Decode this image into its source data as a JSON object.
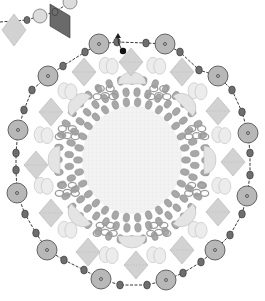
{
  "diagram": {
    "title": "Beaded medallion pattern",
    "kind": "beadwork-pattern",
    "colors": {
      "background": "#ffffff",
      "center_grid": "#f3f3f3",
      "grid_line": "#e6e6e6",
      "large_bead_fill": "#b8b8b8",
      "large_bead_stroke": "#555555",
      "small_bead_fill": "#6e6e6e",
      "small_bead_stroke": "#333333",
      "rondelle_fill": "#a8a8a8",
      "rondelle_stroke": "#8a8a8a",
      "diamond_fill": "#d2d2d2",
      "diamond_stroke": "#b4b4b4",
      "diamond_dark_fill": "#6a6a6a",
      "light_oval_fill": "#ececec",
      "light_oval_stroke": "#bdbdbd",
      "half_dome_fill": "#e4e4e4",
      "ring_stroke": "#9a9a9a",
      "thread": "#222222",
      "black_bead": "#111111"
    },
    "center": [
      132,
      160
    ],
    "outer_large_beads": [
      [
        99,
        44
      ],
      [
        165,
        44
      ],
      [
        218,
        76
      ],
      [
        248,
        133
      ],
      [
        247,
        196
      ],
      [
        215,
        250
      ],
      [
        166,
        280
      ],
      [
        101,
        279
      ],
      [
        47,
        250
      ],
      [
        17,
        193
      ],
      [
        18,
        130
      ],
      [
        48,
        76
      ]
    ],
    "outer_small_beads": [
      [
        117,
        42
      ],
      [
        146,
        43
      ],
      [
        180,
        52
      ],
      [
        199,
        70
      ],
      [
        232,
        90
      ],
      [
        242,
        112
      ],
      [
        250,
        153
      ],
      [
        250,
        175
      ],
      [
        242,
        214
      ],
      [
        230,
        235
      ],
      [
        201,
        262
      ],
      [
        183,
        273
      ],
      [
        147,
        285
      ],
      [
        120,
        285
      ],
      [
        84,
        270
      ],
      [
        64,
        260
      ],
      [
        36,
        233
      ],
      [
        25,
        214
      ],
      [
        16,
        170
      ],
      [
        16,
        153
      ],
      [
        24,
        110
      ],
      [
        32,
        90
      ],
      [
        63,
        66
      ],
      [
        85,
        52
      ]
    ],
    "diamonds": [
      [
        131,
        62
      ],
      [
        182,
        72
      ],
      [
        218,
        111
      ],
      [
        233,
        162
      ],
      [
        218,
        212
      ],
      [
        182,
        250
      ],
      [
        136,
        265
      ],
      [
        88,
        252
      ],
      [
        51,
        213
      ],
      [
        36,
        165
      ],
      [
        51,
        112
      ],
      [
        84,
        72
      ]
    ],
    "top_left_fragment": {
      "large_beads": [
        [
          40,
          16
        ],
        [
          70,
          2
        ]
      ],
      "small_beads": [
        [
          27,
          20
        ],
        [
          55,
          12
        ]
      ],
      "diamond": [
        14,
        30
      ],
      "dark_diamond": [
        60,
        20
      ]
    },
    "start_marker": {
      "black_bead": [
        123,
        51
      ],
      "arrow_tip": [
        118,
        33
      ],
      "label": "start"
    },
    "inner_ring_radius": [
      66,
      72
    ],
    "annotations": []
  }
}
